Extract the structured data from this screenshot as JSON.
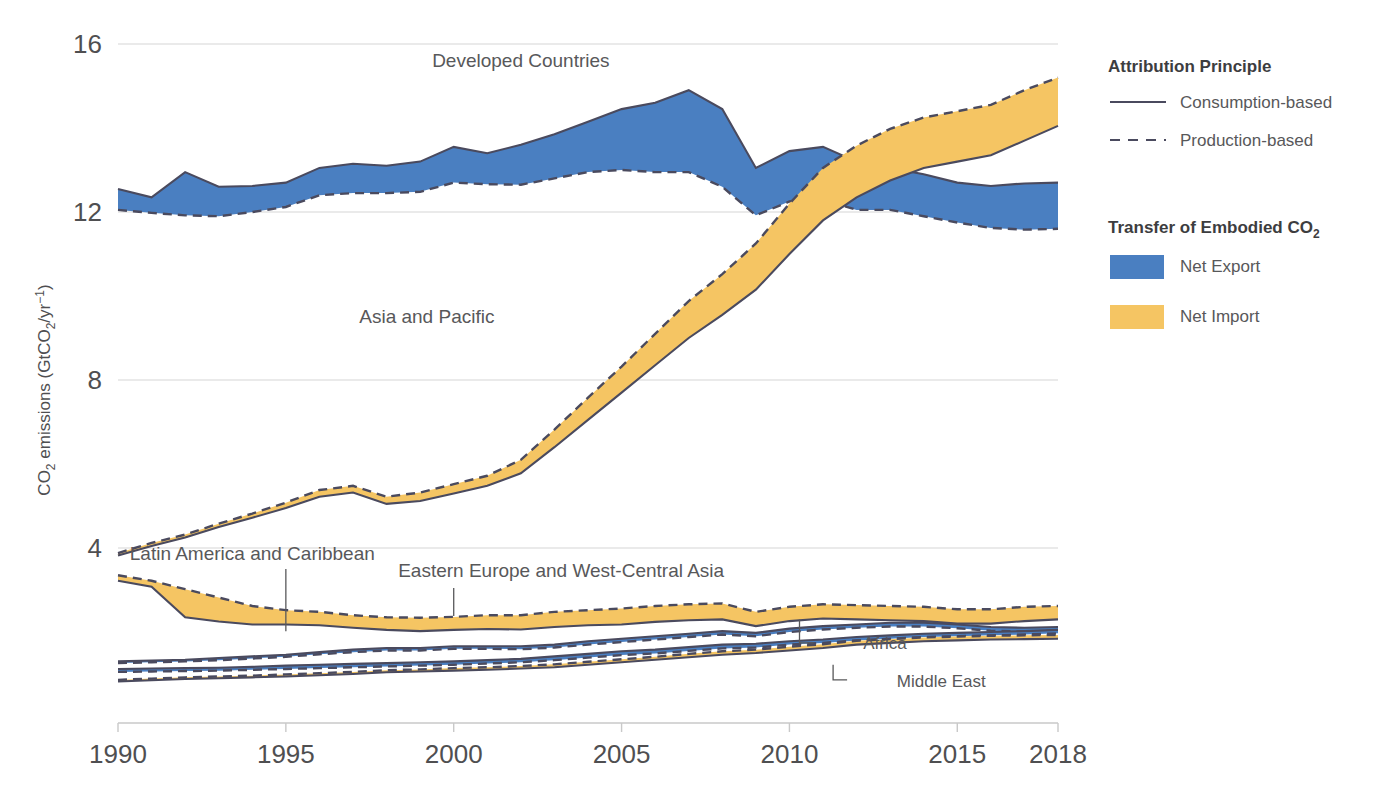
{
  "chart_data": {
    "type": "area",
    "title": "",
    "xlabel": "",
    "ylabel": "CO2 emissions (GtCO2/yr-1)",
    "ylabel_parts": {
      "pre": "CO",
      "sub1": "2",
      "mid": " emissions (GtCO",
      "sub2": "2",
      "post": "/yr",
      "sup": "−1",
      "close": ")"
    },
    "x": [
      1990,
      1991,
      1992,
      1993,
      1994,
      1995,
      1996,
      1997,
      1998,
      1999,
      2000,
      2001,
      2002,
      2003,
      2004,
      2005,
      2006,
      2007,
      2008,
      2009,
      2010,
      2011,
      2012,
      2013,
      2014,
      2015,
      2016,
      2017,
      2018
    ],
    "xlim": [
      1990,
      2018
    ],
    "ylim": [
      0,
      16
    ],
    "yticks": [
      4,
      8,
      12,
      16
    ],
    "xticks": [
      1990,
      1995,
      2000,
      2005,
      2010,
      2015,
      2018
    ],
    "grid": true,
    "legend_position": "right",
    "colors": {
      "net_export": "#4a7fc1",
      "net_import": "#f5c563",
      "line": "#4a4a5e",
      "grid": "#e3e3e3",
      "text": "#58585a"
    },
    "series": [
      {
        "name": "Developed Countries",
        "label_x": 2002.0,
        "label_y": 15.45,
        "label_anchor": "middle",
        "consumption": [
          12.55,
          12.35,
          12.95,
          12.6,
          12.62,
          12.7,
          13.05,
          13.15,
          13.1,
          13.2,
          13.55,
          13.4,
          13.6,
          13.85,
          14.15,
          14.45,
          14.6,
          14.9,
          14.45,
          13.05,
          13.45,
          13.55,
          13.2,
          13.05,
          12.9,
          12.7,
          12.62,
          12.68,
          12.7
        ],
        "production": [
          12.05,
          11.98,
          11.92,
          11.9,
          12.0,
          12.12,
          12.4,
          12.45,
          12.45,
          12.48,
          12.7,
          12.66,
          12.65,
          12.8,
          12.95,
          13.0,
          12.95,
          12.95,
          12.6,
          11.92,
          12.25,
          12.3,
          12.05,
          12.05,
          11.9,
          11.75,
          11.62,
          11.58,
          11.6
        ]
      },
      {
        "name": "Asia and Pacific",
        "label_x": 1999.2,
        "label_y": 9.35,
        "label_anchor": "middle",
        "consumption": [
          3.82,
          4.05,
          4.25,
          4.5,
          4.72,
          4.95,
          5.22,
          5.32,
          5.05,
          5.12,
          5.3,
          5.48,
          5.78,
          6.4,
          7.05,
          7.7,
          8.35,
          9.0,
          9.55,
          10.15,
          11.0,
          11.8,
          12.35,
          12.75,
          13.05,
          13.2,
          13.35,
          13.7,
          14.05
        ],
        "production": [
          3.88,
          4.12,
          4.32,
          4.58,
          4.82,
          5.08,
          5.38,
          5.48,
          5.22,
          5.32,
          5.52,
          5.72,
          6.1,
          6.82,
          7.58,
          8.32,
          9.1,
          9.88,
          10.52,
          11.25,
          12.2,
          13.05,
          13.58,
          13.98,
          14.25,
          14.4,
          14.55,
          14.9,
          15.2
        ]
      },
      {
        "name": "Eastern Europe and West-Central Asia",
        "label_x": 2003.2,
        "label_y": 3.3,
        "label_anchor": "middle",
        "leader": {
          "x": 2000.0,
          "y0": 3.05,
          "y1": 2.38
        },
        "consumption": [
          3.22,
          3.08,
          2.35,
          2.25,
          2.18,
          2.18,
          2.16,
          2.1,
          2.05,
          2.02,
          2.05,
          2.07,
          2.06,
          2.12,
          2.16,
          2.18,
          2.24,
          2.28,
          2.3,
          2.14,
          2.26,
          2.32,
          2.3,
          2.28,
          2.26,
          2.2,
          2.2,
          2.26,
          2.3
        ],
        "production": [
          3.35,
          3.22,
          3.02,
          2.82,
          2.62,
          2.52,
          2.48,
          2.4,
          2.35,
          2.34,
          2.36,
          2.4,
          2.4,
          2.48,
          2.52,
          2.56,
          2.62,
          2.66,
          2.68,
          2.48,
          2.6,
          2.66,
          2.64,
          2.62,
          2.6,
          2.54,
          2.54,
          2.6,
          2.62
        ]
      },
      {
        "name": "Latin America and Caribbean",
        "label_x": 1994.0,
        "label_y": 3.72,
        "label_anchor": "middle",
        "leader": {
          "x": 1995.0,
          "y0": 3.5,
          "y1": 2.02
        },
        "consumption": [
          1.3,
          1.32,
          1.34,
          1.38,
          1.42,
          1.46,
          1.52,
          1.58,
          1.62,
          1.62,
          1.66,
          1.66,
          1.66,
          1.7,
          1.78,
          1.84,
          1.9,
          1.96,
          2.02,
          1.98,
          2.08,
          2.14,
          2.18,
          2.22,
          2.22,
          2.18,
          2.12,
          2.1,
          2.12
        ],
        "production": [
          1.26,
          1.28,
          1.3,
          1.33,
          1.37,
          1.41,
          1.47,
          1.52,
          1.56,
          1.56,
          1.6,
          1.6,
          1.59,
          1.63,
          1.7,
          1.76,
          1.82,
          1.88,
          1.94,
          1.9,
          2.0,
          2.06,
          2.1,
          2.13,
          2.13,
          2.09,
          2.03,
          2.01,
          2.03
        ]
      },
      {
        "name": "Africa",
        "label_x": 2012.2,
        "label_y": 1.6,
        "label_anchor": "start",
        "leader": {
          "x": 2010.3,
          "y0": 2.3,
          "y1": 1.74
        },
        "consumption": [
          1.12,
          1.13,
          1.14,
          1.15,
          1.17,
          1.2,
          1.22,
          1.24,
          1.26,
          1.28,
          1.3,
          1.33,
          1.36,
          1.42,
          1.48,
          1.54,
          1.58,
          1.64,
          1.7,
          1.72,
          1.78,
          1.82,
          1.88,
          1.92,
          1.96,
          1.98,
          2.0,
          2.02,
          2.05
        ],
        "production": [
          1.05,
          1.06,
          1.07,
          1.08,
          1.1,
          1.12,
          1.14,
          1.16,
          1.18,
          1.2,
          1.22,
          1.25,
          1.28,
          1.33,
          1.39,
          1.45,
          1.49,
          1.55,
          1.61,
          1.63,
          1.7,
          1.74,
          1.8,
          1.84,
          1.88,
          1.9,
          1.92,
          1.94,
          1.97
        ]
      },
      {
        "name": "Middle East",
        "label_x": 2013.2,
        "label_y": 0.7,
        "label_anchor": "start",
        "leader": {
          "x": 2011.3,
          "y0": 1.22,
          "y1": 0.86
        },
        "consumption": [
          0.82,
          0.85,
          0.88,
          0.9,
          0.92,
          0.94,
          0.97,
          1.0,
          1.04,
          1.06,
          1.08,
          1.1,
          1.13,
          1.16,
          1.22,
          1.28,
          1.34,
          1.4,
          1.46,
          1.5,
          1.56,
          1.62,
          1.7,
          1.74,
          1.78,
          1.8,
          1.82,
          1.83,
          1.84
        ],
        "production": [
          0.86,
          0.89,
          0.92,
          0.94,
          0.96,
          0.99,
          1.02,
          1.05,
          1.09,
          1.11,
          1.14,
          1.16,
          1.19,
          1.23,
          1.29,
          1.35,
          1.41,
          1.48,
          1.54,
          1.58,
          1.65,
          1.71,
          1.79,
          1.83,
          1.87,
          1.89,
          1.91,
          1.92,
          1.93
        ]
      }
    ]
  },
  "legend": {
    "section1_title": "Attribution Principle",
    "items1": [
      {
        "label": "Consumption-based",
        "style": "solid"
      },
      {
        "label": "Production-based",
        "style": "dashed"
      }
    ],
    "section2_title_parts": {
      "pre": "Transfer of Embodied CO",
      "sub": "2"
    },
    "section2_title": "Transfer of Embodied CO2",
    "items2": [
      {
        "label": "Net Export",
        "color": "#4a7fc1"
      },
      {
        "label": "Net Import",
        "color": "#f5c563"
      }
    ]
  }
}
